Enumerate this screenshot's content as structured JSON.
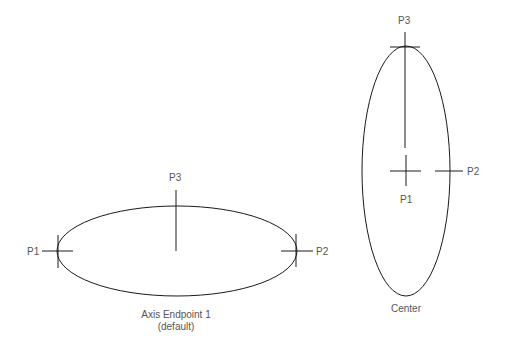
{
  "diagram": {
    "colors": {
      "stroke": "#1a1a1a",
      "label": "#555555",
      "background": "#ffffff"
    },
    "figures": [
      {
        "id": "axis-endpoint",
        "caption_line1": "Axis Endpoint 1",
        "caption_line2": "(default)",
        "points": {
          "p1": "P1",
          "p2": "P2",
          "p3": "P3"
        }
      },
      {
        "id": "center",
        "caption_line1": "Center",
        "points": {
          "p1": "P1",
          "p2": "P2",
          "p3": "P3"
        }
      }
    ]
  }
}
